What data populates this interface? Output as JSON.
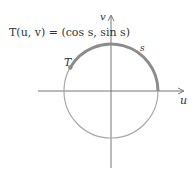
{
  "diagram": {
    "formula": "T(u, v) = (cos s, sin s)",
    "point_label": "T",
    "arc_label": "s",
    "x_axis_label": "u",
    "y_axis_label": "v",
    "arc_start_angle_deg": 0,
    "arc_end_angle_deg": 150,
    "colors": {
      "axis": "#555555",
      "circle": "#9a9a9a",
      "arc": "#8a8a8a",
      "text": "#333333"
    }
  }
}
